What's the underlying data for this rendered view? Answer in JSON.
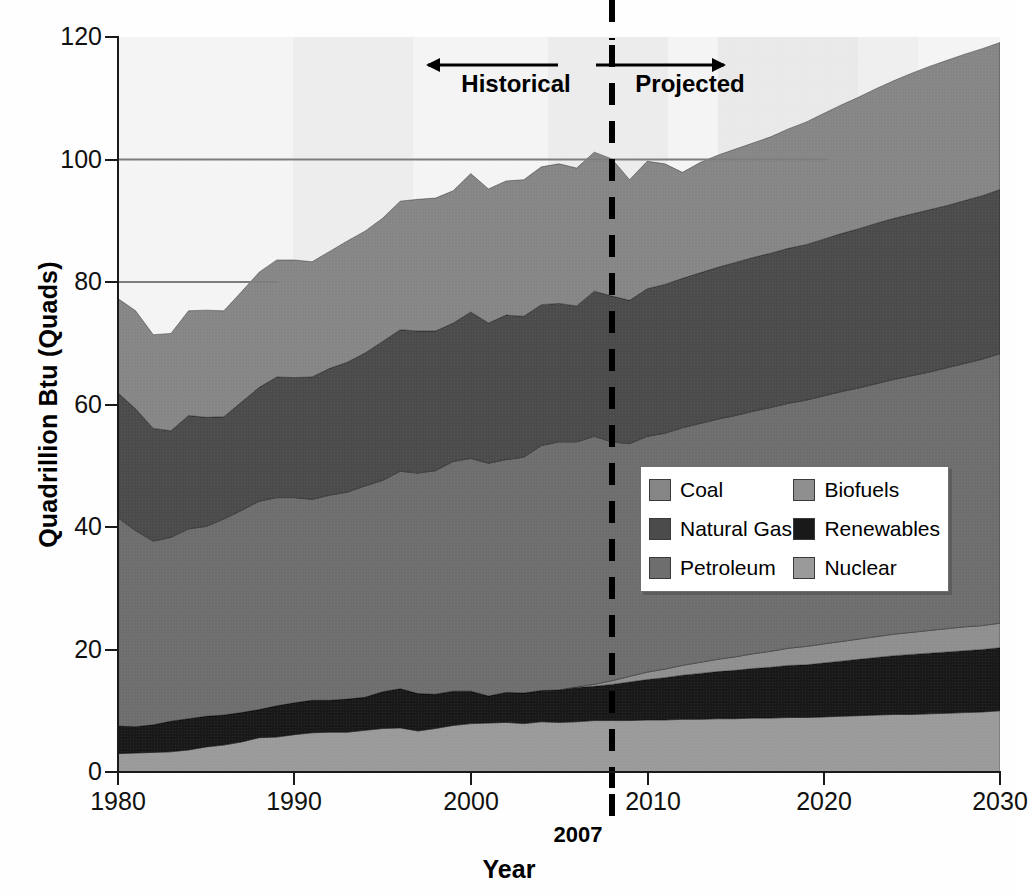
{
  "chart_data": {
    "type": "area",
    "title": "",
    "xlabel": "Year",
    "ylabel": "Quadrillion Btu (Quads)",
    "xlim": [
      1980,
      2030
    ],
    "ylim": [
      0,
      120
    ],
    "xticks": [
      1980,
      1990,
      2000,
      2010,
      2020,
      2030
    ],
    "yticks": [
      0,
      20,
      40,
      60,
      80,
      100,
      120
    ],
    "grid": false,
    "stacked": true,
    "legend_position": "inside-right",
    "marker_year": 2007,
    "marker_label": "2007",
    "annotations": [
      {
        "text": "Historical",
        "arrow": "left",
        "year_span": [
          1994,
          2007
        ]
      },
      {
        "text": "Projected",
        "arrow": "right",
        "year_span": [
          2007,
          2020
        ]
      }
    ],
    "x": [
      1980,
      1981,
      1982,
      1983,
      1984,
      1985,
      1986,
      1987,
      1988,
      1989,
      1990,
      1991,
      1992,
      1993,
      1994,
      1995,
      1996,
      1997,
      1998,
      1999,
      2000,
      2001,
      2002,
      2003,
      2004,
      2005,
      2006,
      2007,
      2008,
      2009,
      2010,
      2011,
      2012,
      2013,
      2014,
      2015,
      2016,
      2017,
      2018,
      2019,
      2020,
      2021,
      2022,
      2023,
      2024,
      2025,
      2026,
      2027,
      2028,
      2029,
      2030
    ],
    "stack_order_bottom_to_top": [
      "Nuclear",
      "Renewables",
      "Biofuels",
      "Petroleum",
      "Natural Gas",
      "Coal"
    ],
    "series": [
      {
        "name": "Nuclear",
        "color": "#9a9a9a",
        "values": [
          3.0,
          3.1,
          3.2,
          3.3,
          3.6,
          4.1,
          4.4,
          4.9,
          5.6,
          5.7,
          6.1,
          6.4,
          6.5,
          6.5,
          6.8,
          7.1,
          7.2,
          6.7,
          7.1,
          7.6,
          7.9,
          8.0,
          8.1,
          7.9,
          8.2,
          8.1,
          8.2,
          8.4,
          8.4,
          8.4,
          8.5,
          8.5,
          8.6,
          8.6,
          8.7,
          8.7,
          8.8,
          8.8,
          8.9,
          8.9,
          9.0,
          9.1,
          9.2,
          9.3,
          9.4,
          9.4,
          9.5,
          9.6,
          9.7,
          9.8,
          10.0
        ]
      },
      {
        "name": "Renewables",
        "color": "#191919",
        "values": [
          4.5,
          4.3,
          4.5,
          5.0,
          5.1,
          5.0,
          4.9,
          4.8,
          4.6,
          5.1,
          5.2,
          5.3,
          5.2,
          5.4,
          5.4,
          6.0,
          6.4,
          6.1,
          5.6,
          5.6,
          5.3,
          4.4,
          4.9,
          5.0,
          5.1,
          5.3,
          5.6,
          5.6,
          5.9,
          6.3,
          6.6,
          6.9,
          7.2,
          7.5,
          7.7,
          7.9,
          8.1,
          8.3,
          8.5,
          8.6,
          8.8,
          9.0,
          9.2,
          9.4,
          9.6,
          9.8,
          9.9,
          10.0,
          10.1,
          10.2,
          10.3
        ]
      },
      {
        "name": "Biofuels",
        "color": "#8f8f8f",
        "values": [
          0.0,
          0.0,
          0.0,
          0.0,
          0.0,
          0.0,
          0.0,
          0.0,
          0.0,
          0.0,
          0.0,
          0.0,
          0.0,
          0.0,
          0.0,
          0.0,
          0.0,
          0.0,
          0.0,
          0.0,
          0.0,
          0.0,
          0.0,
          0.0,
          0.0,
          0.0,
          0.1,
          0.3,
          0.6,
          0.9,
          1.2,
          1.4,
          1.6,
          1.8,
          2.0,
          2.2,
          2.4,
          2.6,
          2.8,
          3.0,
          3.1,
          3.2,
          3.3,
          3.4,
          3.5,
          3.6,
          3.7,
          3.8,
          3.9,
          3.9,
          4.0
        ]
      },
      {
        "name": "Petroleum",
        "color": "#6e6e6e",
        "values": [
          34.0,
          32.0,
          30.0,
          30.0,
          31.0,
          31.0,
          32.0,
          33.0,
          34.0,
          34.0,
          33.5,
          32.8,
          33.5,
          33.8,
          34.5,
          34.5,
          35.5,
          36.0,
          36.5,
          37.5,
          38.0,
          38.0,
          38.0,
          38.5,
          40.0,
          40.5,
          40.0,
          40.5,
          39.0,
          38.0,
          38.5,
          38.5,
          38.8,
          39.0,
          39.2,
          39.4,
          39.6,
          39.8,
          40.0,
          40.2,
          40.5,
          40.8,
          41.0,
          41.3,
          41.6,
          41.9,
          42.2,
          42.6,
          43.0,
          43.5,
          44.0
        ]
      },
      {
        "name": "Natural Gas",
        "color": "#4b4b4b",
        "values": [
          20.4,
          19.9,
          18.4,
          17.4,
          18.5,
          17.8,
          16.7,
          17.7,
          18.6,
          19.7,
          19.6,
          20.0,
          20.7,
          21.2,
          21.7,
          22.7,
          23.1,
          23.2,
          22.8,
          22.6,
          23.9,
          22.9,
          23.6,
          23.0,
          23.0,
          22.6,
          22.2,
          23.7,
          23.8,
          23.4,
          24.1,
          24.3,
          24.4,
          24.6,
          24.8,
          25.0,
          25.1,
          25.2,
          25.3,
          25.4,
          25.6,
          25.8,
          26.0,
          26.2,
          26.3,
          26.4,
          26.5,
          26.5,
          26.6,
          26.7,
          26.8
        ]
      },
      {
        "name": "Coal",
        "color": "#868686",
        "values": [
          15.4,
          16.0,
          15.3,
          15.9,
          17.1,
          17.5,
          17.3,
          18.0,
          18.8,
          19.1,
          19.2,
          18.8,
          19.1,
          19.8,
          19.9,
          20.1,
          21.0,
          21.5,
          21.7,
          21.6,
          22.6,
          21.9,
          21.9,
          22.3,
          22.5,
          22.8,
          22.5,
          22.7,
          22.4,
          19.7,
          20.8,
          19.7,
          17.3,
          18.0,
          18.3,
          18.5,
          18.7,
          19.0,
          19.5,
          20.0,
          20.5,
          21.0,
          21.5,
          22.0,
          22.5,
          23.0,
          23.4,
          23.7,
          23.9,
          24.0,
          24.0
        ]
      }
    ],
    "notes": {
      "total_1980": 77.3,
      "total_2007": 101.2,
      "total_2030": 113.1,
      "minimum_total_year": 1983,
      "minimum_total": 71.6
    }
  },
  "axes": {
    "y_title": "Quadrillion Btu (Quads)",
    "x_title": "Year",
    "y_tick_labels": [
      "120",
      "100",
      "80",
      "60",
      "40",
      "20",
      "0"
    ],
    "x_tick_labels": [
      "1980",
      "1990",
      "2000",
      "2010",
      "2020",
      "2030"
    ]
  },
  "annotations": {
    "historical": "Historical",
    "projected": "Projected",
    "marker_year": "2007"
  },
  "legend": {
    "items": [
      {
        "label": "Coal",
        "color": "#868686"
      },
      {
        "label": "Biofuels",
        "color": "#8f8f8f"
      },
      {
        "label": "Natural Gas",
        "color": "#4b4b4b"
      },
      {
        "label": "Renewables",
        "color": "#191919"
      },
      {
        "label": "Petroleum",
        "color": "#6e6e6e"
      },
      {
        "label": "Nuclear",
        "color": "#9a9a9a"
      }
    ]
  },
  "colors": {
    "plot_background": "#f2f2f2",
    "axis": "#1a1a1a",
    "marker_line": "#000000"
  }
}
